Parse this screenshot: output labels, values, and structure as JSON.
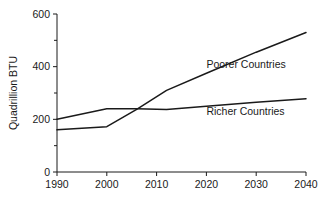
{
  "chart_data": {
    "type": "line",
    "title": "",
    "xlabel": "",
    "ylabel": "Quadrillion BTU",
    "xlim": [
      1990,
      2040
    ],
    "ylim": [
      0,
      600
    ],
    "grid": false,
    "legend_position": "inline-labels",
    "x_ticks": [
      "1990",
      "2000",
      "2010",
      "2020",
      "2030",
      "2040"
    ],
    "x_tick_values": [
      1990,
      2000,
      2010,
      2020,
      2030,
      2040
    ],
    "y_ticks": [
      "0",
      "200",
      "400",
      "600"
    ],
    "y_tick_values": [
      0,
      200,
      400,
      600
    ],
    "y_minor_tick_values": [
      100,
      300,
      500
    ],
    "series": [
      {
        "name": "Poorer Countries",
        "label": "Poorer Countries",
        "color": "#1a1a1a",
        "x": [
          1990,
          2000,
          2006,
          2012,
          2020,
          2030,
          2040
        ],
        "values": [
          160,
          172,
          238,
          310,
          375,
          455,
          530
        ],
        "label_x": 2020,
        "label_y": 395
      },
      {
        "name": "Richer Countries",
        "label": "Richer Countries",
        "color": "#1a1a1a",
        "x": [
          1990,
          2000,
          2006,
          2012,
          2020,
          2030,
          2040
        ],
        "values": [
          200,
          240,
          240,
          237,
          250,
          265,
          278
        ],
        "label_x": 2020,
        "label_y": 218
      }
    ],
    "crossover": {
      "x": 2006,
      "y": 238
    }
  },
  "axis": {
    "y_title": "Quadrillion BTU"
  },
  "colors": {
    "ink": "#1a1a1a",
    "background": "#ffffff"
  }
}
